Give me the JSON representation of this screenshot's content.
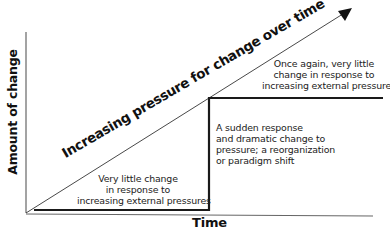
{
  "diagram": {
    "type": "step-change-over-pressure",
    "axes": {
      "y_label": "Amount of change",
      "x_label": "Time"
    },
    "diagonal_arrow": {
      "label": "Increasing pressure for change over time",
      "icon": "arrow-up-right-icon"
    },
    "annotations": {
      "low_phase": {
        "lines": [
          "Very little change",
          "in response to",
          "increasing external pressures"
        ]
      },
      "jump_phase": {
        "lines": [
          "A sudden response",
          "and dramatic change to",
          "pressure; a reorganization",
          "or paradigm shift"
        ]
      },
      "high_phase": {
        "lines": [
          "Once again, very little",
          "change in response to",
          "increasing external pressures"
        ]
      }
    },
    "colors": {
      "line": "#1a1a1a",
      "axis": "#555555",
      "text": "#222222",
      "background": "#ffffff"
    }
  }
}
